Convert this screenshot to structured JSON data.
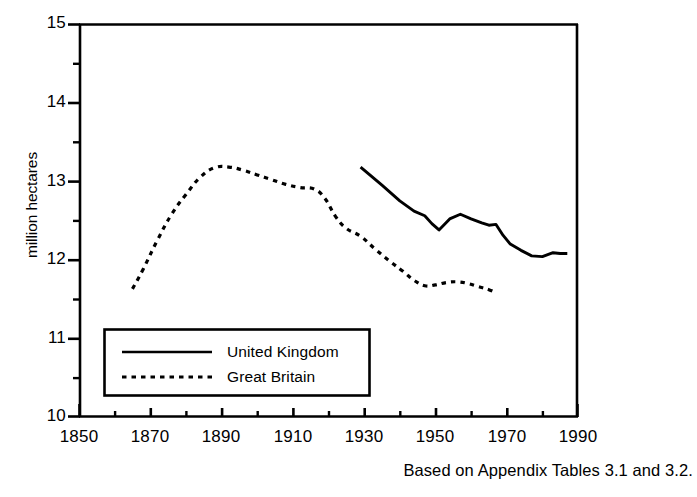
{
  "chart_data": {
    "type": "line",
    "title": "",
    "subtitle": "",
    "xlabel": "",
    "ylabel": "million hectares",
    "xlim": [
      1850,
      1990
    ],
    "ylim": [
      10,
      15
    ],
    "grid": false,
    "legend_position": "inside lower-left",
    "x_ticks_major": [
      1850,
      1870,
      1890,
      1910,
      1930,
      1950,
      1970,
      1990
    ],
    "x_ticks_minor": [
      1860,
      1880,
      1900,
      1920,
      1940,
      1960,
      1980
    ],
    "x_tick_labels": [
      "1850",
      "1870",
      "1890",
      "1910",
      "1930",
      "1950",
      "1970",
      "1990"
    ],
    "y_ticks_major": [
      10,
      11,
      12,
      13,
      14,
      15
    ],
    "y_ticks_minor": [
      10.5,
      11.5,
      12.5,
      13.5,
      14.5
    ],
    "y_tick_labels": [
      "10",
      "11",
      "12",
      "13",
      "14",
      "15"
    ],
    "annotation": "Based on Appendix Tables 3.1 and 3.2.",
    "series": [
      {
        "name": "United Kingdom",
        "style": "solid",
        "color": "#000000",
        "x": [
          1929,
          1935,
          1940,
          1944,
          1947,
          1949,
          1951,
          1954,
          1957,
          1960,
          1963,
          1965,
          1967,
          1969,
          1971,
          1974,
          1977,
          1980,
          1983,
          1985,
          1987
        ],
        "y": [
          13.18,
          12.95,
          12.75,
          12.62,
          12.56,
          12.46,
          12.38,
          12.52,
          12.58,
          12.52,
          12.47,
          12.44,
          12.45,
          12.31,
          12.2,
          12.12,
          12.05,
          12.04,
          12.09,
          12.08,
          12.08
        ]
      },
      {
        "name": "Great Britain",
        "style": "dotted",
        "color": "#000000",
        "x": [
          1865,
          1868,
          1872,
          1876,
          1880,
          1884,
          1888,
          1892,
          1896,
          1900,
          1904,
          1908,
          1912,
          1916,
          1919,
          1922,
          1925,
          1929,
          1933,
          1937,
          1941,
          1944,
          1947,
          1950,
          1953,
          1956,
          1959,
          1962,
          1965,
          1967
        ],
        "y": [
          11.63,
          11.88,
          12.25,
          12.58,
          12.83,
          13.05,
          13.17,
          13.18,
          13.14,
          13.08,
          13.02,
          12.96,
          12.92,
          12.9,
          12.78,
          12.55,
          12.4,
          12.3,
          12.14,
          11.99,
          11.85,
          11.74,
          11.67,
          11.68,
          11.71,
          11.72,
          11.7,
          11.66,
          11.62,
          11.58
        ]
      }
    ]
  },
  "axes": {
    "y_label": "million hectares"
  },
  "legend": {
    "entries": [
      {
        "label": "United Kingdom",
        "style": "solid"
      },
      {
        "label": "Great Britain",
        "style": "dotted"
      }
    ]
  },
  "footer": {
    "source_note": "Based on Appendix Tables 3.1 and 3.2."
  }
}
